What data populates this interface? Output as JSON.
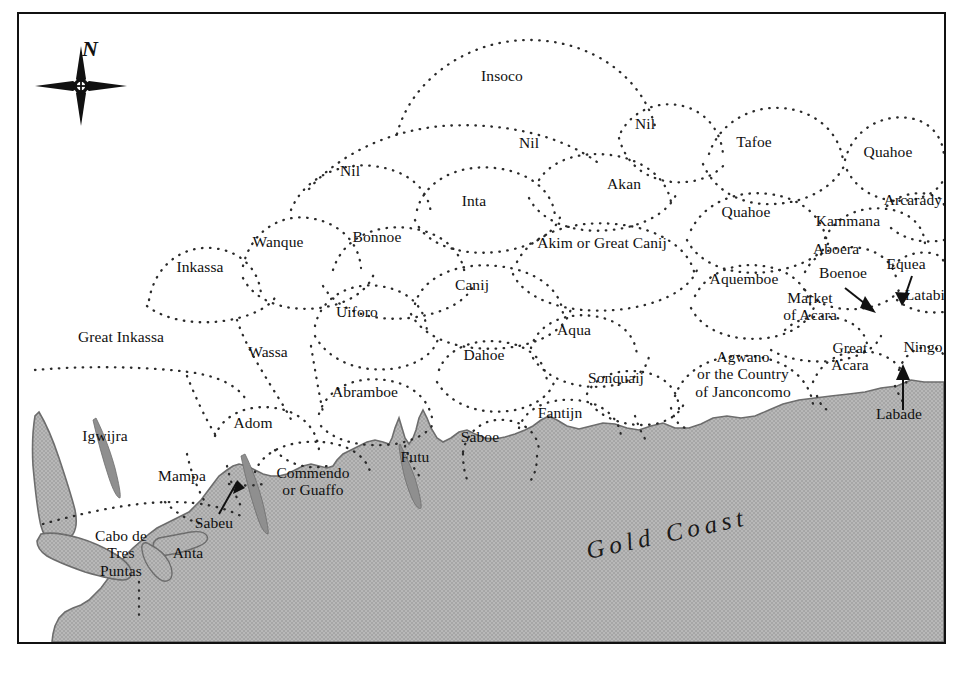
{
  "map": {
    "title_on_sea": "Gold Coast",
    "compass": {
      "north_label": "N",
      "icon": "compass-star-icon"
    },
    "frame": {
      "border_color": "#111111",
      "land_color": "#ffffff",
      "sea_color": "#b3b3b3"
    },
    "colors": {
      "sea": "#b3b3b3",
      "sea_outline": "#6d6d6d",
      "land": "#ffffff",
      "border_dots": "#2a2a2a",
      "frame": "#111111",
      "text": "#101010"
    },
    "regions": [
      {
        "name": "Insoco",
        "x": 500,
        "y": 74,
        "lines": [
          "Insoco"
        ]
      },
      {
        "name": "Nil (centre)",
        "x": 348,
        "y": 169,
        "lines": [
          "Nil"
        ]
      },
      {
        "name": "Nil (upper centre)",
        "x": 527,
        "y": 141,
        "lines": [
          "Nil"
        ]
      },
      {
        "name": "Nil (upper right)",
        "x": 643,
        "y": 122,
        "lines": [
          "Nil"
        ]
      },
      {
        "name": "Tafoe",
        "x": 752,
        "y": 140,
        "lines": [
          "Tafoe"
        ]
      },
      {
        "name": "Quahoe (north)",
        "x": 886,
        "y": 150,
        "lines": [
          "Quahoe"
        ]
      },
      {
        "name": "Akan",
        "x": 622,
        "y": 182,
        "lines": [
          "Akan"
        ]
      },
      {
        "name": "Inta",
        "x": 472,
        "y": 199,
        "lines": [
          "Inta"
        ]
      },
      {
        "name": "Arcarady",
        "x": 911,
        "y": 198,
        "lines": [
          "Arcarady"
        ]
      },
      {
        "name": "Quahoe (centre)",
        "x": 744,
        "y": 210,
        "lines": [
          "Quahoe"
        ]
      },
      {
        "name": "Kammana",
        "x": 846,
        "y": 219,
        "lines": [
          "Kammana"
        ]
      },
      {
        "name": "Inkassa",
        "x": 198,
        "y": 265,
        "lines": [
          "Inkassa"
        ]
      },
      {
        "name": "Wanque",
        "x": 276,
        "y": 240,
        "lines": [
          "Wanque"
        ]
      },
      {
        "name": "Bonnoe",
        "x": 375,
        "y": 235,
        "lines": [
          "Bonnoe"
        ]
      },
      {
        "name": "Akim or Great Canij",
        "x": 600,
        "y": 241,
        "lines": [
          "Akim or Great Canij"
        ]
      },
      {
        "name": "Aboera",
        "x": 834,
        "y": 247,
        "lines": [
          "Aboera"
        ]
      },
      {
        "name": "Equea",
        "x": 904,
        "y": 262,
        "lines": [
          "Equea"
        ]
      },
      {
        "name": "Canij",
        "x": 470,
        "y": 283,
        "lines": [
          "Canij"
        ]
      },
      {
        "name": "Aquemboe",
        "x": 742,
        "y": 277,
        "lines": [
          "Aquemboe"
        ]
      },
      {
        "name": "Boenoe",
        "x": 841,
        "y": 271,
        "lines": [
          "Boenoe"
        ]
      },
      {
        "name": "Latabij",
        "x": 925,
        "y": 293,
        "lines": [
          "Latabij"
        ]
      },
      {
        "name": "Uiforo",
        "x": 355,
        "y": 310,
        "lines": [
          "Uiforo"
        ]
      },
      {
        "name": "Market of Acara",
        "x": 808,
        "y": 304,
        "lines": [
          "Market",
          "of Acara"
        ]
      },
      {
        "name": "Great Inkassa",
        "x": 119,
        "y": 335,
        "lines": [
          "Great Inkassa"
        ]
      },
      {
        "name": "Aqua",
        "x": 572,
        "y": 328,
        "lines": [
          "Aqua"
        ]
      },
      {
        "name": "Wassa",
        "x": 266,
        "y": 350,
        "lines": [
          "Wassa"
        ]
      },
      {
        "name": "Dahoe",
        "x": 482,
        "y": 353,
        "lines": [
          "Dahoe"
        ]
      },
      {
        "name": "Great Acara",
        "x": 848,
        "y": 354,
        "lines": [
          "Great",
          "Acara"
        ]
      },
      {
        "name": "Ningo",
        "x": 921,
        "y": 345,
        "lines": [
          "Ningo"
        ]
      },
      {
        "name": "Agwano or the Country of Janconcomo",
        "x": 741,
        "y": 372,
        "lines": [
          "Agwano",
          "or the Country",
          "of Janconcomo"
        ]
      },
      {
        "name": "Sonquaij",
        "x": 614,
        "y": 376,
        "lines": [
          "Sonquaij"
        ]
      },
      {
        "name": "Abramboe",
        "x": 363,
        "y": 390,
        "lines": [
          "Abramboe"
        ]
      },
      {
        "name": "Fantijn",
        "x": 558,
        "y": 411,
        "lines": [
          "Fantijn"
        ]
      },
      {
        "name": "Adom",
        "x": 251,
        "y": 421,
        "lines": [
          "Adom"
        ]
      },
      {
        "name": "Igwijra",
        "x": 103,
        "y": 434,
        "lines": [
          "Igwijra"
        ]
      },
      {
        "name": "Saboe",
        "x": 478,
        "y": 435,
        "lines": [
          "Saboe"
        ]
      },
      {
        "name": "Futu",
        "x": 413,
        "y": 455,
        "lines": [
          "Futu"
        ]
      },
      {
        "name": "Labade",
        "x": 897,
        "y": 412,
        "lines": [
          "Labade"
        ]
      },
      {
        "name": "Mampa",
        "x": 180,
        "y": 474,
        "lines": [
          "Mampa"
        ]
      },
      {
        "name": "Commendo or Guaffo",
        "x": 311,
        "y": 479,
        "lines": [
          "Commendo",
          "or Guaffo"
        ]
      },
      {
        "name": "Sabeu",
        "x": 212,
        "y": 521,
        "lines": [
          "Sabeu"
        ]
      },
      {
        "name": "Anta",
        "x": 186,
        "y": 551,
        "lines": [
          "Anta"
        ]
      },
      {
        "name": "Cabo de Tres Puntas",
        "x": 119,
        "y": 551,
        "lines": [
          "Cabo de",
          "Tres",
          "Puntas"
        ]
      }
    ],
    "pointer_arrows": [
      {
        "name": "sabeu-arrow",
        "from": [
          205,
          507
        ],
        "to": [
          224,
          478
        ]
      },
      {
        "name": "boenoe-arrow",
        "from": [
          842,
          284
        ],
        "to": [
          869,
          305
        ]
      },
      {
        "name": "equea-arrow",
        "from": [
          904,
          275
        ],
        "to": [
          893,
          297
        ]
      },
      {
        "name": "labade-arrow",
        "from": [
          896,
          400
        ],
        "to": [
          896,
          362
        ]
      }
    ]
  }
}
